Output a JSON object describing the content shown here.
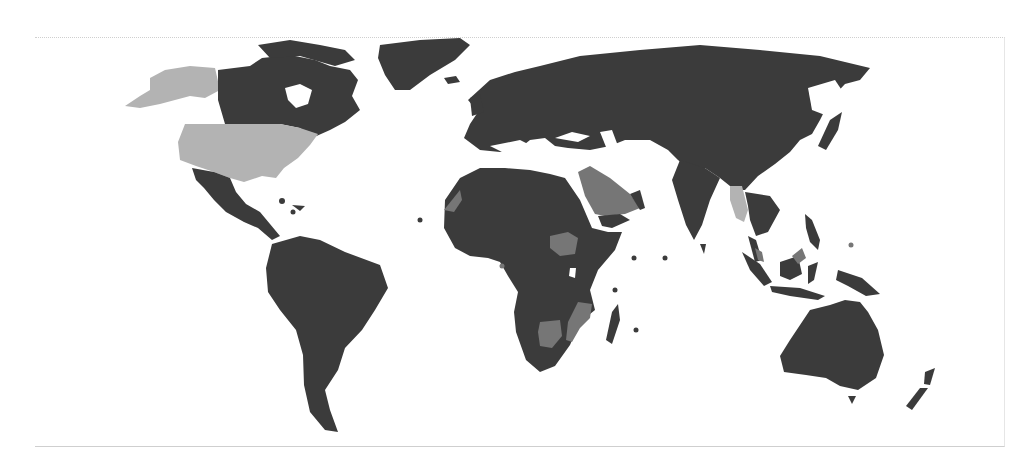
{
  "map": {
    "type": "world-choropleth",
    "projection": "equirectangular-like",
    "legend": null,
    "title": null,
    "colors": {
      "category_dark": "#3b3b3b",
      "category_medium": "#767676",
      "category_light": "#b3b3b3",
      "water": "#ffffff",
      "frame": "#cfcfcf"
    },
    "regions": [
      {
        "name": "Alaska",
        "category": "light"
      },
      {
        "name": "United States (contiguous)",
        "category": "light"
      },
      {
        "name": "Canada",
        "category": "dark"
      },
      {
        "name": "Greenland",
        "category": "dark"
      },
      {
        "name": "Mexico & Central America",
        "category": "dark"
      },
      {
        "name": "South America",
        "category": "dark"
      },
      {
        "name": "Europe",
        "category": "dark"
      },
      {
        "name": "Russia & Central Asia",
        "category": "dark"
      },
      {
        "name": "China & East Asia",
        "category": "dark"
      },
      {
        "name": "Japan",
        "category": "dark"
      },
      {
        "name": "India",
        "category": "dark"
      },
      {
        "name": "Saudi Arabia",
        "category": "medium"
      },
      {
        "name": "Yemen",
        "category": "dark"
      },
      {
        "name": "Western Sahara",
        "category": "medium"
      },
      {
        "name": "Africa (most)",
        "category": "dark"
      },
      {
        "name": "South Sudan",
        "category": "medium"
      },
      {
        "name": "Botswana",
        "category": "medium"
      },
      {
        "name": "Mozambique",
        "category": "medium"
      },
      {
        "name": "Madagascar",
        "category": "dark"
      },
      {
        "name": "Myanmar",
        "category": "light"
      },
      {
        "name": "Southeast Asia",
        "category": "dark"
      },
      {
        "name": "Malaysia (Borneo)",
        "category": "medium"
      },
      {
        "name": "Indonesia",
        "category": "dark"
      },
      {
        "name": "Philippines",
        "category": "dark"
      },
      {
        "name": "Papua New Guinea",
        "category": "dark"
      },
      {
        "name": "Australia",
        "category": "dark"
      },
      {
        "name": "New Zealand",
        "category": "dark"
      }
    ]
  }
}
